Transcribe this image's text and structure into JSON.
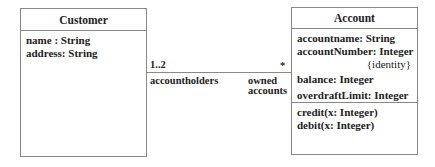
{
  "customer": {
    "name": "Customer",
    "attributes": [
      "name : String",
      "address: String"
    ]
  },
  "account": {
    "name": "Account",
    "attributes": [
      "accountname: String",
      "accountNumber: Integer",
      "{identity}",
      "balance: Integer",
      "overdraftLimit: Integer"
    ],
    "operations": [
      "credit(x: Integer)",
      "debit(x: Integer)"
    ]
  },
  "association": {
    "left_multiplicity": "1..2",
    "right_multiplicity": "*",
    "left_role": "accountholders",
    "right_role_line1": "owned",
    "right_role_line2": "accounts"
  }
}
